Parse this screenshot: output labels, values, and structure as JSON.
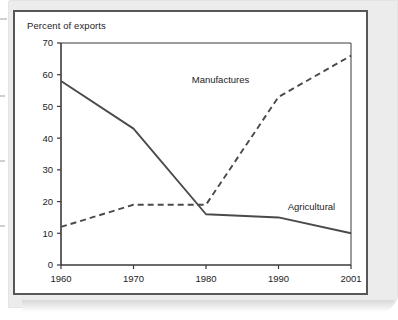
{
  "figure": {
    "axis_title": "Percent of exports"
  },
  "chart_data": {
    "type": "line",
    "title": "Percent of exports",
    "xlabel": "",
    "ylabel": "Percent of exports",
    "x": [
      "1960",
      "1970",
      "1980",
      "1990",
      "2001"
    ],
    "categories": [
      "1960",
      "1970",
      "1980",
      "1990",
      "2001"
    ],
    "ylim": [
      0,
      70
    ],
    "yticks": [
      0,
      10,
      20,
      30,
      40,
      50,
      60,
      70
    ],
    "ytick_labels": [
      "0",
      "10",
      "20",
      "30",
      "40",
      "50",
      "60",
      "70"
    ],
    "xtick_labels": [
      "1960",
      "1970",
      "1980",
      "1990",
      "2001"
    ],
    "grid": false,
    "legend": "inline-annotations",
    "series": [
      {
        "name": "Agricultural",
        "style": "solid",
        "color": "#4a4a4d",
        "values": [
          58,
          43,
          16,
          15,
          10
        ],
        "label": "Agricultural",
        "label_x": 1995,
        "label_y": 17.5
      },
      {
        "name": "Manufactures",
        "style": "dashed",
        "color": "#4a4a4d",
        "values": [
          12,
          19,
          19,
          53,
          66
        ],
        "label": "Manufactures",
        "label_x": 1982,
        "label_y": 57.5
      }
    ],
    "annotations": [
      "Manufactures",
      "Agricultural"
    ]
  },
  "colors": {
    "line": "#4a4a4d",
    "axis": "#3a3a3d",
    "card_border": "#57575a",
    "page_background": "#ececed",
    "plot_background": "#ffffff",
    "text": "#1c1c1e"
  }
}
